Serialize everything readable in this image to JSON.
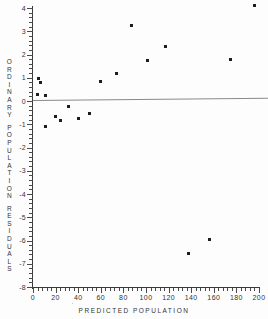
{
  "chart_data": {
    "type": "scatter",
    "title": "",
    "xlabel": "PREDICTED POPULATION",
    "ylabel": "ORDINARY POPULATION RESIDUALS",
    "xlim": [
      0,
      200
    ],
    "ylim": [
      -8,
      4
    ],
    "grid": false,
    "legend": null,
    "xticks": [
      0,
      20,
      40,
      60,
      80,
      100,
      120,
      140,
      160,
      180,
      200
    ],
    "xtick_labels": [
      "0",
      "20",
      "40",
      "60",
      "80",
      "100",
      "120",
      "140",
      "160",
      "180",
      "200"
    ],
    "yticks": [
      4,
      3,
      2,
      1,
      0,
      -1,
      -2,
      -3,
      -4,
      -5,
      -6,
      -7,
      -8
    ],
    "ytick_labels": [
      "4",
      "3",
      "2",
      "1",
      "0",
      "-1",
      "-2",
      "-3",
      "-4",
      "-5",
      "-6",
      "-7",
      "-8"
    ],
    "reference_line": {
      "type": "horizontal",
      "y": 0,
      "color": "#8a8a8a"
    },
    "marker": {
      "shape": "square",
      "color": "#1c1c1c",
      "size": 3
    },
    "points": [
      {
        "x": 4,
        "y": 0.3
      },
      {
        "x": 5,
        "y": 0.95
      },
      {
        "x": 7,
        "y": 0.8
      },
      {
        "x": 11,
        "y": 0.25
      },
      {
        "x": 11,
        "y": -1.1
      },
      {
        "x": 20,
        "y": -0.65
      },
      {
        "x": 24,
        "y": -0.85
      },
      {
        "x": 31,
        "y": -0.25
      },
      {
        "x": 40,
        "y": -0.75
      },
      {
        "x": 50,
        "y": -0.55
      },
      {
        "x": 60,
        "y": 0.85
      },
      {
        "x": 74,
        "y": 1.2
      },
      {
        "x": 87,
        "y": 3.25
      },
      {
        "x": 101,
        "y": 1.75
      },
      {
        "x": 117,
        "y": 2.35
      },
      {
        "x": 138,
        "y": -6.55
      },
      {
        "x": 156,
        "y": -5.95
      },
      {
        "x": 175,
        "y": 1.8
      },
      {
        "x": 196,
        "y": 4.1
      }
    ]
  },
  "axes": {
    "y_title_letters": [
      "O",
      "R",
      "D",
      "I",
      "N",
      "A",
      "R",
      "Y",
      "P",
      "O",
      "P",
      "U",
      "L",
      "A",
      "T",
      "I",
      "O",
      "N",
      "R",
      "E",
      "S",
      "I",
      "D",
      "U",
      "A",
      "L",
      "S"
    ]
  }
}
